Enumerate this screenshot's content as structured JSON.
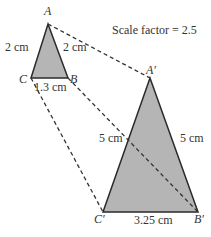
{
  "diagram": {
    "title": "Scale factor = 2.5",
    "colors": {
      "fill": "#b5b5b5",
      "stroke": "#2a2a2a",
      "dash": "#333333",
      "text": "#333333"
    },
    "small_triangle": {
      "vertices": {
        "A": {
          "label": "A",
          "x": 48,
          "y": 24
        },
        "B": {
          "label": "B",
          "x": 68,
          "y": 78
        },
        "C": {
          "label": "C",
          "x": 31,
          "y": 78
        }
      },
      "sides": {
        "AC": "2 cm",
        "AB": "2 cm",
        "CB": "1.3 cm"
      }
    },
    "large_triangle": {
      "vertices": {
        "A": {
          "label": "A′",
          "x": 150,
          "y": 78
        },
        "B": {
          "label": "B′",
          "x": 198,
          "y": 212
        },
        "C": {
          "label": "C′",
          "x": 103,
          "y": 212
        }
      },
      "sides": {
        "AC": "5 cm",
        "AB": "5 cm",
        "CB": "3.25 cm"
      }
    }
  }
}
